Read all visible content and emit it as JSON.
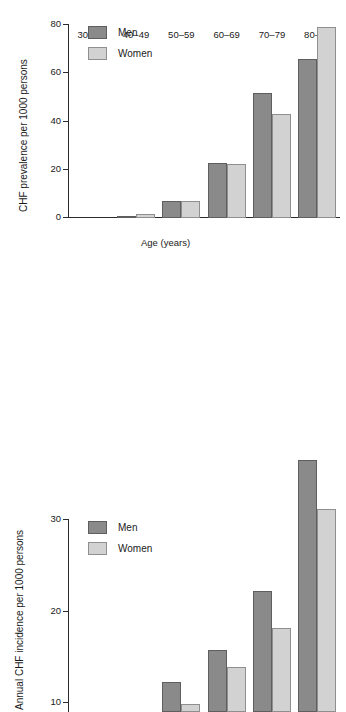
{
  "figure": {
    "background": "#ffffff",
    "men_color": "#8a8a8a",
    "women_color": "#d2d2d2"
  },
  "legend": {
    "men_label": "Men",
    "women_label": "Women"
  },
  "chart_data": [
    {
      "type": "bar",
      "panel": "top",
      "title": "",
      "xlabel": "Age (years)",
      "ylabel": "CHF prevalence per 1000 persons",
      "categories": [
        "30–39",
        "40–49",
        "50–59",
        "60–69",
        "70–79",
        "80–89"
      ],
      "series": [
        {
          "name": "Men",
          "color": "#8a8a8a",
          "values": [
            0,
            0.8,
            7.2,
            23,
            52,
            66
          ]
        },
        {
          "name": "Women",
          "color": "#d2d2d2",
          "values": [
            0,
            1.8,
            7.0,
            22.5,
            43,
            79
          ]
        }
      ],
      "ylim": [
        0,
        80
      ],
      "yticks": [
        0,
        20,
        40,
        60,
        80
      ],
      "ytick_labels": [
        "0",
        "20",
        "40",
        "60",
        "80"
      ],
      "grid": false,
      "legend_position": "upper-left"
    },
    {
      "type": "bar",
      "panel": "bottom",
      "title": "",
      "xlabel": "",
      "ylabel": "Annual CHF incidence per 1000 persons",
      "categories": [
        "30–39",
        "40–49",
        "50–59",
        "60–69",
        "70–79",
        "80–89"
      ],
      "series": [
        {
          "name": "Men",
          "color": "#8a8a8a",
          "values": [
            0,
            0,
            3.3,
            6.8,
            13.2,
            27.5
          ]
        },
        {
          "name": "Women",
          "color": "#d2d2d2",
          "values": [
            0,
            0,
            0.9,
            4.9,
            9.2,
            22.2
          ]
        }
      ],
      "ylim": [
        0,
        30
      ],
      "yticks": [
        10,
        20,
        30
      ],
      "ytick_labels": [
        "10",
        "20",
        "30"
      ],
      "grid": false,
      "legend_position": "upper-left",
      "note": "x-axis cropped by image edge"
    }
  ]
}
